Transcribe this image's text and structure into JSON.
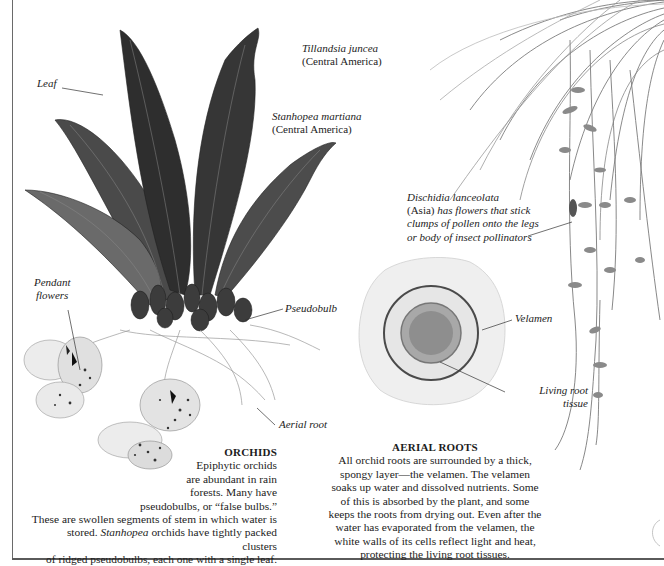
{
  "labels": {
    "leaf": "Leaf",
    "pendant_flowers_1": "Pendant",
    "pendant_flowers_2": "flowers",
    "pseudobulb": "Pseudobulb",
    "aerial_root": "Aerial root",
    "velamen": "Velamen",
    "living_root_1": "Living root",
    "living_root_2": "tissue"
  },
  "species": {
    "tillandsia": {
      "name": "Tillandsia juncea",
      "region": "(Central America)"
    },
    "stanhopea": {
      "name": "Stanhopea martiana",
      "region": "(Central America)"
    },
    "dischidia": {
      "name": "Dischidia lanceolata",
      "line1_region": "(Asia)",
      "line1_rest": " has flowers that stick",
      "line2": "clumps of pollen onto the legs",
      "line3": "or body of insect pollinators"
    }
  },
  "orchids": {
    "heading": "ORCHIDS",
    "lines": [
      "Epiphytic orchids",
      "are abundant in rain",
      "forests. Many have",
      "pseudobulbs, or “false bulbs.”",
      "These are swollen segments of stem in which water is"
    ],
    "line6_pre": "stored. ",
    "line6_ital": "Stanhopea",
    "line6_post": " orchids have tightly packed clusters",
    "line7": "of ridged pseudobulbs, each one with a single leaf."
  },
  "aerial_roots": {
    "heading": "AERIAL ROOTS",
    "lines": [
      "All orchid roots are surrounded by a thick,",
      "spongy layer—the velamen. The velamen",
      "soaks up water and dissolved nutrients. Some",
      "of this is absorbed by the plant, and some",
      "keeps the roots from drying out. Even after the",
      "water has evaporated from the velamen, the",
      "white walls of its cells reflect light and heat,",
      "protecting the living root tissues."
    ]
  },
  "colors": {
    "text": "#1c1c1c",
    "leaf_dark": "#3a3a3a",
    "frame": "#6a6a6a"
  }
}
